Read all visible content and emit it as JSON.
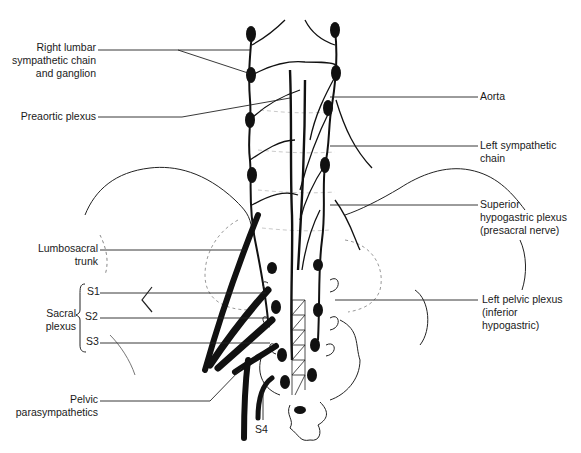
{
  "diagram": {
    "type": "anatomical illustration",
    "background": "#ffffff",
    "ink_color": "#111111",
    "labels_left": {
      "right_lumbar": [
        "Right lumbar",
        "sympathetic chain",
        "and ganglion"
      ],
      "preaortic": "Preaortic plexus",
      "lumbosacral": [
        "Lumbosacral",
        "trunk"
      ],
      "sacral_plexus": [
        "Sacral",
        "plexus"
      ],
      "s1": "S1",
      "s2": "S2",
      "s3": "S3",
      "pelvic_parasympathetics": [
        "Pelvic",
        "parasympathetics"
      ]
    },
    "labels_right": {
      "aorta": "Aorta",
      "left_sympathetic": [
        "Left sympathetic",
        "chain"
      ],
      "superior_hypogastric": [
        "Superior",
        "hypogastric plexus",
        "(presacral nerve)"
      ],
      "left_pelvic": [
        "Left pelvic plexus",
        "(inferior",
        "hypogastric)"
      ]
    },
    "labels_bottom": {
      "s4": "S4"
    }
  }
}
